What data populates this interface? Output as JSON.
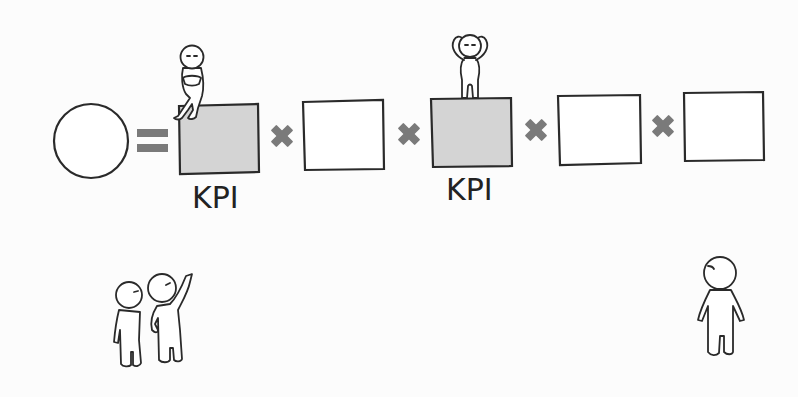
{
  "diagram": {
    "result": {
      "shape": "circle",
      "fill": "#ffffff"
    },
    "operator_equals": "equals-icon",
    "operator_times": "multiply-icon",
    "factors": [
      {
        "highlighted": true,
        "fill": "#d4d4d4",
        "label": "KPI",
        "figure": "sitting-figure"
      },
      {
        "highlighted": false,
        "fill": "#ffffff",
        "label": ""
      },
      {
        "highlighted": true,
        "fill": "#d4d4d4",
        "label": "KPI",
        "figure": "standing-figure-hands-on-head"
      },
      {
        "highlighted": false,
        "fill": "#ffffff",
        "label": ""
      },
      {
        "highlighted": false,
        "fill": "#ffffff",
        "label": ""
      }
    ],
    "observers": [
      {
        "name": "two-figures-pointing"
      },
      {
        "name": "lone-figure"
      }
    ]
  },
  "labels": {
    "kpi_1": "KPI",
    "kpi_2": "KPI"
  },
  "colors": {
    "stroke": "#2a2a2a",
    "operator": "#7a7a7a",
    "kpi_fill": "#d4d4d4",
    "plain_fill": "#ffffff",
    "background": "#fcfcfc"
  }
}
